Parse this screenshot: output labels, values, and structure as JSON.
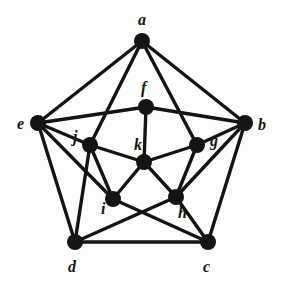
{
  "figure": {
    "kind": "undirected-graph-diagram",
    "title": "",
    "background_color": "#fdfdfc",
    "ink_color": "#141414",
    "vertex_radius": 8,
    "edge_width": 3.4,
    "label_font_size": 16
  },
  "graph": {
    "vertex_count": 11,
    "edge_count": 24,
    "vertices": [
      {
        "id": "a",
        "label": "a",
        "x": 142,
        "y": 41,
        "label_x": 138,
        "label_y": 12,
        "ring": "outer"
      },
      {
        "id": "b",
        "label": "b",
        "x": 245,
        "y": 123,
        "label_x": 258,
        "label_y": 117,
        "ring": "outer"
      },
      {
        "id": "c",
        "label": "c",
        "x": 208,
        "y": 242,
        "label_x": 203,
        "label_y": 259,
        "ring": "outer"
      },
      {
        "id": "d",
        "label": "d",
        "x": 75,
        "y": 242,
        "label_x": 68,
        "label_y": 259,
        "ring": "outer"
      },
      {
        "id": "e",
        "label": "e",
        "x": 38,
        "y": 123,
        "label_x": 17,
        "label_y": 116,
        "ring": "outer"
      },
      {
        "id": "f",
        "label": "f",
        "x": 146,
        "y": 107,
        "label_x": 141,
        "label_y": 80,
        "ring": "inner"
      },
      {
        "id": "g",
        "label": "g",
        "x": 197,
        "y": 145,
        "label_x": 210,
        "label_y": 133,
        "ring": "inner"
      },
      {
        "id": "h",
        "label": "h",
        "x": 176,
        "y": 197,
        "label_x": 178,
        "label_y": 205,
        "ring": "inner"
      },
      {
        "id": "i",
        "label": "i",
        "x": 113,
        "y": 199,
        "label_x": 101,
        "label_y": 201,
        "ring": "inner"
      },
      {
        "id": "j",
        "label": "j",
        "x": 90,
        "y": 145,
        "label_x": 73,
        "label_y": 129,
        "ring": "inner"
      },
      {
        "id": "k",
        "label": "k",
        "x": 144,
        "y": 162,
        "label_x": 134,
        "label_y": 137,
        "ring": "center"
      }
    ],
    "edges": [
      {
        "from": "a",
        "to": "e",
        "name": "edge-a-e"
      },
      {
        "from": "a",
        "to": "b",
        "name": "edge-a-b"
      },
      {
        "from": "a",
        "to": "j",
        "name": "edge-a-j"
      },
      {
        "from": "a",
        "to": "g",
        "name": "edge-a-g"
      },
      {
        "from": "e",
        "to": "f",
        "name": "edge-e-f"
      },
      {
        "from": "e",
        "to": "j",
        "name": "edge-e-j"
      },
      {
        "from": "e",
        "to": "i",
        "name": "edge-e-i"
      },
      {
        "from": "e",
        "to": "d",
        "name": "edge-e-d"
      },
      {
        "from": "b",
        "to": "f",
        "name": "edge-b-f"
      },
      {
        "from": "b",
        "to": "g",
        "name": "edge-b-g"
      },
      {
        "from": "b",
        "to": "h",
        "name": "edge-b-h"
      },
      {
        "from": "b",
        "to": "c",
        "name": "edge-b-c"
      },
      {
        "from": "d",
        "to": "c",
        "name": "edge-d-c"
      },
      {
        "from": "d",
        "to": "j",
        "name": "edge-d-j"
      },
      {
        "from": "d",
        "to": "h",
        "name": "edge-d-h"
      },
      {
        "from": "c",
        "to": "i",
        "name": "edge-c-i"
      },
      {
        "from": "c",
        "to": "h",
        "name": "edge-c-h"
      },
      {
        "from": "f",
        "to": "k",
        "name": "edge-f-k"
      },
      {
        "from": "g",
        "to": "k",
        "name": "edge-g-k"
      },
      {
        "from": "h",
        "to": "k",
        "name": "edge-h-k"
      },
      {
        "from": "i",
        "to": "k",
        "name": "edge-i-k"
      },
      {
        "from": "j",
        "to": "k",
        "name": "edge-j-k"
      },
      {
        "from": "j",
        "to": "i",
        "name": "edge-j-i"
      },
      {
        "from": "g",
        "to": "h",
        "name": "edge-g-h"
      }
    ]
  }
}
